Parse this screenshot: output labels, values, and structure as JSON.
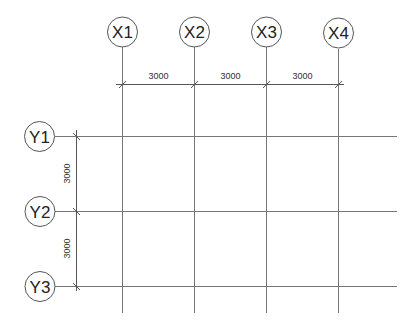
{
  "drawing": {
    "type": "structural-grid-plan",
    "line_color": "#777777",
    "bubble_stroke": "#555555",
    "text_color": "#222222"
  },
  "x_axes": [
    {
      "label": "X1",
      "x": 122
    },
    {
      "label": "X2",
      "x": 194
    },
    {
      "label": "X3",
      "x": 266
    },
    {
      "label": "X4",
      "x": 338
    }
  ],
  "y_axes": [
    {
      "label": "Y1",
      "y": 136
    },
    {
      "label": "Y2",
      "y": 211
    },
    {
      "label": "Y3",
      "y": 286
    }
  ],
  "x_dimensions": [
    {
      "value": "3000",
      "from": "X1",
      "to": "X2"
    },
    {
      "value": "3000",
      "from": "X2",
      "to": "X3"
    },
    {
      "value": "3000",
      "from": "X3",
      "to": "X4"
    }
  ],
  "y_dimensions": [
    {
      "value": "3000",
      "from": "Y1",
      "to": "Y2"
    },
    {
      "value": "3000",
      "from": "Y2",
      "to": "Y3"
    }
  ]
}
